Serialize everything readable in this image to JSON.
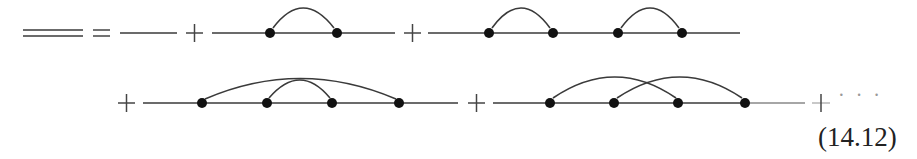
{
  "equation": {
    "number": "(14.12)",
    "continuation": "· · ·",
    "description": "Dyson-type expansion of the full (dressed) propagator (double line) as a sum of Feynman diagrams with bare propagators and vertex insertions connected by arcs"
  },
  "colors": {
    "line": "#3a3a3a",
    "vertex": "#111111",
    "background": "#ffffff"
  },
  "terms": [
    {
      "label": "dressed-propagator",
      "vertices": 0,
      "arcs": []
    },
    {
      "label": "bare-propagator",
      "vertices": 0,
      "arcs": []
    },
    {
      "label": "one-self-energy-insertion",
      "vertices": 2,
      "arcs": [
        [
          1,
          2
        ]
      ]
    },
    {
      "label": "two-self-energy-insertions",
      "vertices": 4,
      "arcs": [
        [
          1,
          2
        ],
        [
          3,
          4
        ]
      ]
    },
    {
      "label": "nested-rainbow",
      "vertices": 4,
      "arcs": [
        [
          1,
          4
        ],
        [
          2,
          3
        ]
      ]
    },
    {
      "label": "crossed",
      "vertices": 4,
      "arcs": [
        [
          1,
          3
        ],
        [
          2,
          4
        ]
      ]
    }
  ],
  "operators": [
    "=",
    "+",
    "+",
    "+",
    "+",
    "+"
  ]
}
